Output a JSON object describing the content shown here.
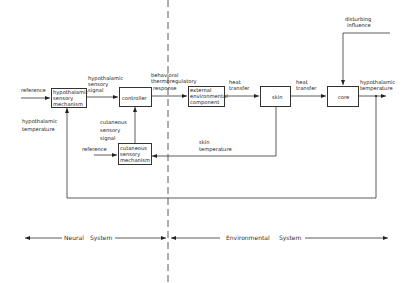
{
  "diagram": {
    "title": "",
    "boxes": {
      "hypothalamic": [
        "hypothalamic",
        "sensory",
        "mechanism"
      ],
      "controller": "controller",
      "external": [
        "external",
        "environmental",
        "component"
      ],
      "skin": "skin",
      "core": "core",
      "cutaneous": [
        "cutaneous",
        "sensory",
        "mechanism"
      ]
    },
    "labels": {
      "reference_top": "reference",
      "hypothalamic_signal": [
        "hypothalamic",
        "sensory",
        "signal"
      ],
      "behavioral": [
        "behavioral",
        "thermoregulatory",
        "response"
      ],
      "heat_transfer_1": [
        "heat",
        "transfer"
      ],
      "heat_transfer_2": [
        "heat",
        "transfer"
      ],
      "hypothalamic_temp_out": [
        "hypothalamic",
        "temperature"
      ],
      "disturbing": [
        "disturbing",
        "influence"
      ],
      "hypothalamic_temp_left": [
        "hypothalamic",
        "temperature"
      ],
      "cutaneous_signal": [
        "cutaneous",
        "sensory",
        "signal"
      ],
      "reference_bottom": "reference",
      "skin_temp": [
        "skin",
        "temperature"
      ]
    },
    "systems": {
      "neural": [
        "Neural",
        "System"
      ],
      "environmental": [
        "Environmental",
        "System"
      ]
    }
  }
}
